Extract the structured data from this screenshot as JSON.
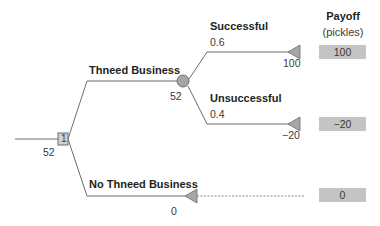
{
  "payoff_header": {
    "title": "Payoff",
    "unit": "(pickles)"
  },
  "decision_node": {
    "id": "1",
    "value": "52",
    "shape": "square"
  },
  "chance_node": {
    "value": "52",
    "shape": "circle"
  },
  "branches": {
    "thneed": {
      "label": "Thneed Business"
    },
    "no_thneed": {
      "label": "No Thneed Business",
      "value": "0"
    },
    "successful": {
      "label": "Successful",
      "probability": "0.6",
      "value": "100"
    },
    "unsuccessful": {
      "label": "Unsuccessful",
      "probability": "0.4",
      "value": "−20"
    }
  },
  "payoffs": {
    "successful": "100",
    "unsuccessful": "−20",
    "no_thneed": "0"
  },
  "colors": {
    "line": "#6d6d6d",
    "node_fill": "#a6a6a6",
    "payoff_fill": "#c4c4c4",
    "text": "#231f20"
  }
}
